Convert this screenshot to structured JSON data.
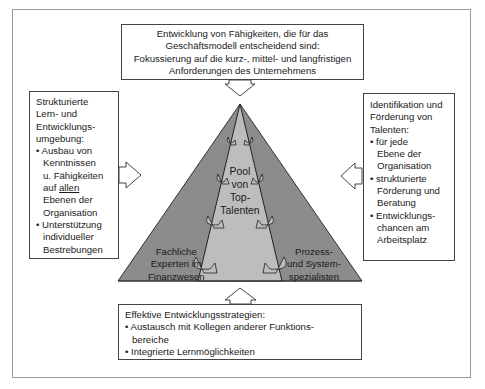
{
  "diagram": {
    "top_box": {
      "lines": [
        "Entwicklung von Fähigkeiten, die für das",
        "Geschäftsmodell entscheidend sind:",
        "Fokussierung auf die kurz-, mittel- und langfristigen",
        "Anforderungen des Unternehmens"
      ]
    },
    "left_box": {
      "heading": [
        "Strukturierte",
        "Lern- und",
        "Entwicklungs-",
        "umgebung:"
      ],
      "bullet1": [
        "Ausbau von",
        "Kenntnissen",
        "u. Fähigkeiten"
      ],
      "bullet1_auf": "auf ",
      "bullet1_allen": "allen",
      "bullet1_rest": [
        "Ebenen der",
        "Organisation"
      ],
      "bullet2": [
        "Unterstützung",
        "individueller",
        "Bestrebungen"
      ]
    },
    "right_box": {
      "heading": [
        "Identifikation und",
        "Förderung von",
        "Talenten:"
      ],
      "bullet1": [
        "für jede",
        "Ebene der",
        "Organisation"
      ],
      "bullet2": [
        "strukturierte",
        "Förderung und",
        "Beratung"
      ],
      "bullet3": [
        "Entwicklungs-",
        "chancen am",
        "Arbeitsplatz"
      ]
    },
    "bottom_box": {
      "heading": "Effektive Entwicklungsstrategien:",
      "bullet1": [
        "Austausch mit Kollegen anderer Funktions-",
        "bereiche"
      ],
      "bullet2": "Integrierte Lernmöglichkeiten"
    },
    "pyramid": {
      "center": [
        "Pool",
        "von",
        "Top-",
        "Talenten"
      ],
      "left": [
        "Fachliche",
        "Experten im",
        "Finanzwesen"
      ],
      "right": [
        "Prozess-",
        "und System-",
        "spezialisten"
      ]
    },
    "bullet_char": "•",
    "colors": {
      "outer_pyramid": "#8c8c8c",
      "inner_pyramid": "#bdbdbd",
      "border": "#444444",
      "frame": "#9a9a9a"
    }
  }
}
